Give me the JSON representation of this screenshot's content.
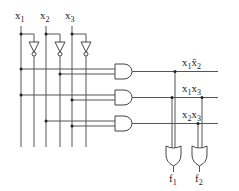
{
  "diagram": {
    "type": "logic-circuit",
    "inputs": [
      {
        "name": "x",
        "sub": "1"
      },
      {
        "name": "x",
        "sub": "2"
      },
      {
        "name": "x",
        "sub": "3"
      }
    ],
    "product_terms": [
      {
        "label_a": "x",
        "sub_a": "1",
        "label_b": "x̄",
        "sub_b": "2",
        "text": "x1x̄2"
      },
      {
        "label_a": "x",
        "sub_a": "1",
        "label_b": "x",
        "sub_b": "3",
        "text": "x1x3"
      },
      {
        "label_a": "x",
        "sub_a": "2",
        "label_b": "x",
        "sub_b": "3",
        "text": "x2x3"
      }
    ],
    "outputs": [
      {
        "name": "f",
        "sub": "1"
      },
      {
        "name": "f",
        "sub": "2"
      }
    ],
    "colors": {
      "wire": "#555555",
      "gate": "#444444",
      "background": "#ffffff"
    }
  }
}
